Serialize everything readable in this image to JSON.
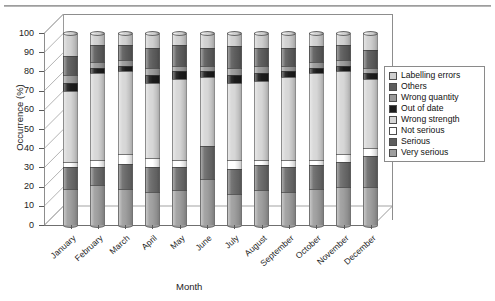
{
  "chart_data": {
    "type": "bar",
    "subtype": "stacked-100-percent-3d-cylinder",
    "title": "",
    "xlabel": "Month",
    "ylabel": "Occurrence (%)",
    "ylim": [
      0,
      100
    ],
    "ytick_step": 10,
    "yticks": [
      0,
      10,
      20,
      30,
      40,
      50,
      60,
      70,
      80,
      90,
      100
    ],
    "grid": false,
    "legend_position": "right",
    "categories": [
      "January",
      "February",
      "March",
      "April",
      "May",
      "June",
      "July",
      "August",
      "September",
      "October",
      "November",
      "December"
    ],
    "series": [
      {
        "name": "Very serious",
        "color": "#9e9e9e",
        "values": [
          19,
          21,
          19,
          17,
          18,
          24,
          16,
          18,
          17,
          19,
          20,
          20
        ]
      },
      {
        "name": "Serious",
        "color": "#6b6b6b",
        "values": [
          11,
          9,
          13,
          13,
          12,
          17,
          13,
          13,
          13,
          12,
          13,
          16
        ]
      },
      {
        "name": "Not serious",
        "color": "#ffffff",
        "values": [
          3,
          4,
          5,
          5,
          4,
          0,
          5,
          3,
          4,
          3,
          4,
          4
        ]
      },
      {
        "name": "Wrong strength",
        "color": "#d6d6d6",
        "values": [
          37,
          45,
          43,
          39,
          42,
          36,
          40,
          41,
          43,
          45,
          43,
          36
        ]
      },
      {
        "name": "Out of date",
        "color": "#1c1c1c",
        "values": [
          4,
          3,
          3,
          4,
          4,
          3,
          4,
          4,
          3,
          3,
          3,
          3
        ]
      },
      {
        "name": "Wrong quantity",
        "color": "#9a9a9a",
        "values": [
          4,
          3,
          3,
          4,
          3,
          3,
          4,
          4,
          3,
          3,
          3,
          3
        ]
      },
      {
        "name": "Others",
        "color": "#5e5e5e",
        "values": [
          10,
          9,
          8,
          10,
          11,
          9,
          11,
          9,
          9,
          8,
          8,
          9
        ]
      },
      {
        "name": "Labelling errors",
        "color": "#cfcfcf",
        "values": [
          12,
          6,
          6,
          8,
          6,
          8,
          7,
          8,
          8,
          7,
          6,
          9
        ]
      }
    ]
  },
  "legend": {
    "items": [
      {
        "label": "Labelling errors",
        "color": "#cfcfcf"
      },
      {
        "label": "Others",
        "color": "#5e5e5e"
      },
      {
        "label": "Wrong quantity",
        "color": "#9a9a9a"
      },
      {
        "label": "Out of date",
        "color": "#1c1c1c"
      },
      {
        "label": "Wrong strength",
        "color": "#d6d6d6"
      },
      {
        "label": "Not serious",
        "color": "#ffffff"
      },
      {
        "label": "Serious",
        "color": "#5e5e5e"
      },
      {
        "label": "Very serious",
        "color": "#9e9e9e"
      }
    ]
  },
  "axes": {
    "y_title": "Occurrence (%)",
    "x_title": "Month",
    "y_tick_labels": [
      "100",
      "90",
      "80",
      "70",
      "60",
      "50",
      "40",
      "30",
      "20",
      "10",
      "0"
    ]
  }
}
